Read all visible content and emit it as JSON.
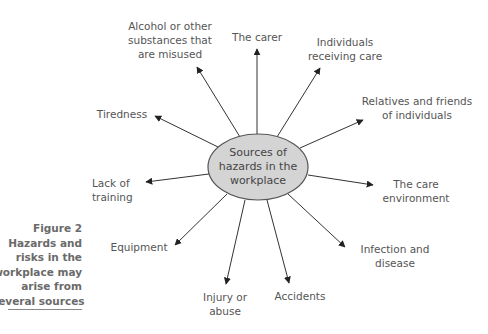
{
  "center": {
    "lines": [
      "Sources of",
      "hazards in the",
      "workplace"
    ],
    "fill": "#d4d4d4",
    "stroke": "#555555"
  },
  "sources": [
    {
      "id": "alcohol",
      "lines": [
        "Alcohol or other",
        "substances that",
        "are misused"
      ]
    },
    {
      "id": "carer",
      "lines": [
        "The carer"
      ]
    },
    {
      "id": "individuals",
      "lines": [
        "Individuals",
        "receiving care"
      ]
    },
    {
      "id": "relatives",
      "lines": [
        "Relatives and friends",
        "of individuals"
      ]
    },
    {
      "id": "tiredness",
      "lines": [
        "Tiredness"
      ]
    },
    {
      "id": "training",
      "lines": [
        "Lack of",
        "training"
      ]
    },
    {
      "id": "environment",
      "lines": [
        "The care",
        "environment"
      ]
    },
    {
      "id": "equipment",
      "lines": [
        "Equipment"
      ]
    },
    {
      "id": "infection",
      "lines": [
        "Infection and",
        "disease"
      ]
    },
    {
      "id": "injury",
      "lines": [
        "Injury or",
        "abuse"
      ]
    },
    {
      "id": "accidents",
      "lines": [
        "Accidents"
      ]
    }
  ],
  "caption": {
    "lines": [
      "Figure 2",
      "Hazards and",
      "risks in the",
      "workplace may",
      "arise from",
      "several sources"
    ]
  },
  "colors": {
    "arrow": "#333333",
    "label_text": "#555555",
    "caption_text": "#6a6a6a"
  }
}
